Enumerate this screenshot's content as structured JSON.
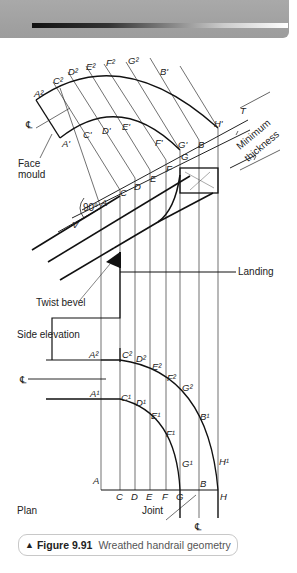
{
  "header": {
    "decoration": "gray-band-with-gradient-bar"
  },
  "diagram": {
    "title": "Wreathed handrail geometry",
    "labels": {
      "face_mould": [
        "Face",
        "mould"
      ],
      "minimum_thickness": [
        "Minimum",
        "thickness"
      ],
      "twist_bevel": "Twist bevel",
      "landing": "Landing",
      "side_elevation": "Side elevation",
      "plan": "Plan",
      "joint": "Joint",
      "angle": "90°",
      "centreline": "CL",
      "T": "T",
      "V": "V"
    },
    "face_mould_points_outer": [
      "A²",
      "C²",
      "D²",
      "E²",
      "F²",
      "G²",
      "B'",
      "H'"
    ],
    "face_mould_points_inner": [
      "A'",
      "C'",
      "D'",
      "E'",
      "F'",
      "G'",
      "B"
    ],
    "pitch_line_points": [
      "A",
      "C",
      "D",
      "E",
      "F",
      "G",
      "B"
    ],
    "plan_outer_points": [
      "A²",
      "C²",
      "D²",
      "E²",
      "F²",
      "G²",
      "B¹",
      "H¹"
    ],
    "plan_inner_points": [
      "A¹",
      "C¹",
      "D¹",
      "E¹",
      "F¹",
      "G¹"
    ],
    "plan_base_points": [
      "A",
      "C",
      "D",
      "E",
      "F",
      "G",
      "B",
      "H"
    ]
  },
  "caption": {
    "marker": "▲",
    "figure_number": "Figure 9.91",
    "title": "Wreathed handrail geometry"
  }
}
